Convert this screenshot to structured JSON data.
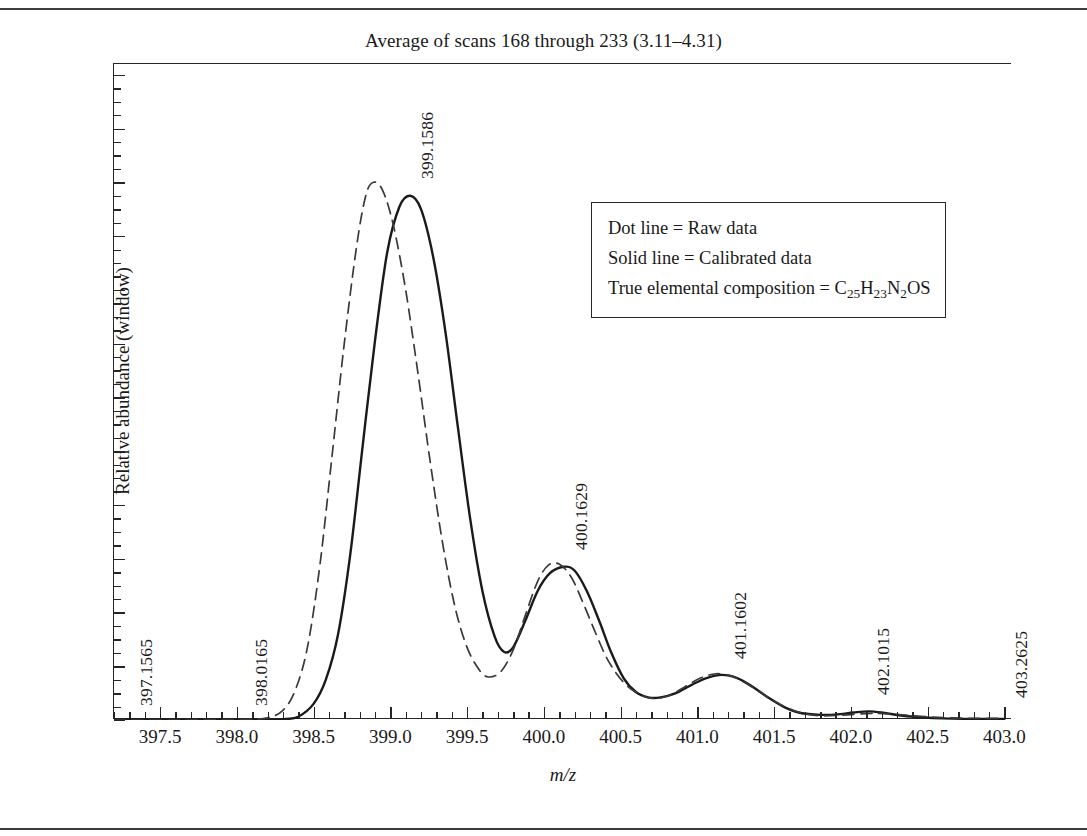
{
  "chart_data": {
    "type": "line",
    "title": "Average of scans 168 through 233 (3.11–4.31)",
    "xlabel": "m/z",
    "ylabel": "Relative abundance (window)",
    "xlim": [
      397.2,
      403.05
    ],
    "ylim": [
      0.0,
      1.22
    ],
    "grid": false,
    "legend_position": "inside-upper-right",
    "x_ticks": [
      "397.5",
      "398.0",
      "398.5",
      "399.0",
      "399.5",
      "400.0",
      "400.5",
      "401.0",
      "401.5",
      "402.0",
      "402.5",
      "403.0"
    ],
    "x_tick_values": [
      397.5,
      398.0,
      398.5,
      399.0,
      399.5,
      400.0,
      400.5,
      401.0,
      401.5,
      402.0,
      402.5,
      403.0
    ],
    "x_minor_interval": 0.1,
    "y_ticks": [
      "0.0",
      "0.1",
      "0.2",
      "0.3",
      "0.4",
      "0.5",
      "0.6",
      "0.7",
      "0.8",
      "0.9",
      "1.0",
      "1.1",
      "1.2"
    ],
    "y_tick_values": [
      0.0,
      0.1,
      0.2,
      0.3,
      0.4,
      0.5,
      0.6,
      0.7,
      0.8,
      0.9,
      1.0,
      1.1,
      1.2
    ],
    "y_minor_interval": 0.025,
    "series": [
      {
        "name": "Calibrated data",
        "style": "solid",
        "color": "#1a1a1a",
        "points": [
          [
            397.2,
            0.0
          ],
          [
            397.6,
            0.0
          ],
          [
            398.0,
            0.0
          ],
          [
            398.2,
            0.001
          ],
          [
            398.32,
            0.002
          ],
          [
            398.4,
            0.006
          ],
          [
            398.5,
            0.03
          ],
          [
            398.58,
            0.075
          ],
          [
            398.66,
            0.16
          ],
          [
            398.74,
            0.31
          ],
          [
            398.82,
            0.51
          ],
          [
            398.9,
            0.705
          ],
          [
            398.98,
            0.87
          ],
          [
            399.06,
            0.955
          ],
          [
            399.13,
            0.975
          ],
          [
            399.2,
            0.95
          ],
          [
            399.28,
            0.86
          ],
          [
            399.36,
            0.72
          ],
          [
            399.44,
            0.545
          ],
          [
            399.52,
            0.375
          ],
          [
            399.6,
            0.24
          ],
          [
            399.68,
            0.155
          ],
          [
            399.74,
            0.127
          ],
          [
            399.8,
            0.135
          ],
          [
            399.88,
            0.185
          ],
          [
            399.96,
            0.24
          ],
          [
            400.04,
            0.273
          ],
          [
            400.13,
            0.285
          ],
          [
            400.2,
            0.278
          ],
          [
            400.28,
            0.24
          ],
          [
            400.36,
            0.185
          ],
          [
            400.44,
            0.125
          ],
          [
            400.52,
            0.078
          ],
          [
            400.6,
            0.052
          ],
          [
            400.68,
            0.042
          ],
          [
            400.76,
            0.042
          ],
          [
            400.86,
            0.05
          ],
          [
            400.96,
            0.065
          ],
          [
            401.06,
            0.078
          ],
          [
            401.16,
            0.084
          ],
          [
            401.26,
            0.078
          ],
          [
            401.36,
            0.062
          ],
          [
            401.46,
            0.042
          ],
          [
            401.56,
            0.025
          ],
          [
            401.66,
            0.014
          ],
          [
            401.78,
            0.01
          ],
          [
            401.9,
            0.01
          ],
          [
            402.02,
            0.014
          ],
          [
            402.12,
            0.016
          ],
          [
            402.22,
            0.013
          ],
          [
            402.34,
            0.008
          ],
          [
            402.46,
            0.005
          ],
          [
            402.6,
            0.003
          ],
          [
            402.8,
            0.002
          ],
          [
            403.0,
            0.002
          ]
        ]
      },
      {
        "name": "Raw data",
        "style": "dashed",
        "color": "#3a3a3a",
        "points": [
          [
            397.2,
            0.0
          ],
          [
            397.7,
            0.0
          ],
          [
            398.05,
            0.001
          ],
          [
            398.2,
            0.004
          ],
          [
            398.3,
            0.018
          ],
          [
            398.38,
            0.055
          ],
          [
            398.46,
            0.135
          ],
          [
            398.54,
            0.285
          ],
          [
            398.62,
            0.49
          ],
          [
            398.7,
            0.7
          ],
          [
            398.78,
            0.88
          ],
          [
            398.84,
            0.975
          ],
          [
            398.89,
            1.0
          ],
          [
            398.95,
            0.985
          ],
          [
            399.02,
            0.92
          ],
          [
            399.1,
            0.8
          ],
          [
            399.18,
            0.645
          ],
          [
            399.26,
            0.48
          ],
          [
            399.34,
            0.33
          ],
          [
            399.42,
            0.212
          ],
          [
            399.5,
            0.135
          ],
          [
            399.58,
            0.093
          ],
          [
            399.64,
            0.08
          ],
          [
            399.72,
            0.09
          ],
          [
            399.8,
            0.13
          ],
          [
            399.88,
            0.195
          ],
          [
            399.96,
            0.258
          ],
          [
            400.03,
            0.288
          ],
          [
            400.1,
            0.29
          ],
          [
            400.18,
            0.265
          ],
          [
            400.26,
            0.215
          ],
          [
            400.34,
            0.16
          ],
          [
            400.42,
            0.11
          ],
          [
            400.52,
            0.07
          ],
          [
            400.62,
            0.048
          ],
          [
            400.72,
            0.04
          ],
          [
            400.82,
            0.046
          ],
          [
            400.92,
            0.062
          ],
          [
            401.02,
            0.078
          ],
          [
            401.12,
            0.086
          ],
          [
            401.22,
            0.082
          ],
          [
            401.32,
            0.068
          ],
          [
            401.44,
            0.046
          ],
          [
            401.56,
            0.026
          ],
          [
            401.68,
            0.013
          ],
          [
            401.8,
            0.008
          ],
          [
            401.95,
            0.009
          ],
          [
            402.1,
            0.012
          ],
          [
            402.22,
            0.012
          ],
          [
            402.36,
            0.009
          ],
          [
            402.5,
            0.006
          ],
          [
            402.66,
            0.004
          ],
          [
            402.84,
            0.003
          ],
          [
            403.0,
            0.003
          ]
        ]
      }
    ],
    "annotations": [
      {
        "text": "397.1565",
        "x": 397.3,
        "y": 0.015
      },
      {
        "text": "398.0165",
        "x": 398.05,
        "y": 0.015
      },
      {
        "text": "399.1586",
        "x": 399.13,
        "y": 0.995
      },
      {
        "text": "400.1629",
        "x": 400.13,
        "y": 0.305
      },
      {
        "text": "401.1602",
        "x": 401.17,
        "y": 0.102
      },
      {
        "text": "402.1015",
        "x": 402.1,
        "y": 0.035
      },
      {
        "text": "403.2625",
        "x": 403.0,
        "y": 0.03
      }
    ]
  },
  "legend": {
    "lines": [
      {
        "label": "Dot line = Raw data"
      },
      {
        "label": "Solid line = Calibrated data"
      }
    ],
    "composition_prefix": "True elemental composition = C",
    "composition_sub1": "25",
    "composition_mid1": "H",
    "composition_sub2": "23",
    "composition_mid2": "N",
    "composition_sub3": "2",
    "composition_suffix": "OS"
  }
}
